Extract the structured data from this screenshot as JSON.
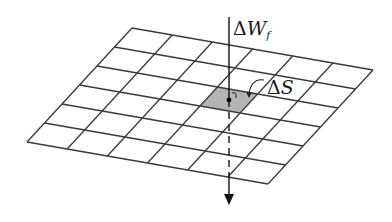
{
  "diagram": {
    "type": "surface-grid-with-flux-arrow",
    "grid": {
      "columns": 6,
      "rows": 6,
      "corners": {
        "top_left": [
          132,
          28
        ],
        "top_right": [
          373,
          70
        ],
        "bottom_right": [
          268,
          184
        ],
        "bottom_left": [
          27,
          142
        ]
      },
      "line_color": "#3a3a3a",
      "shaded_cell": {
        "column": 3,
        "row": 2,
        "fill": "#b4b4b4"
      }
    },
    "arrow": {
      "x": 229,
      "y_start": 17,
      "dash_start": 100,
      "dash_end": 178,
      "y_end": 205,
      "color": "#111111"
    },
    "point": {
      "x": 229,
      "y": 100
    },
    "labels": {
      "work": {
        "prefix": "Δ",
        "symbol": "W",
        "subscript": "f"
      },
      "area": {
        "prefix": "Δ",
        "symbol": "S"
      }
    }
  }
}
